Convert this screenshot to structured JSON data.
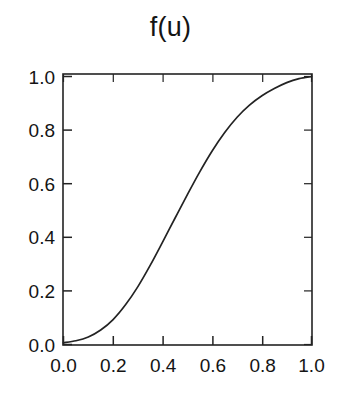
{
  "chart_data": {
    "type": "line",
    "title": "f(u)",
    "xlabel": "",
    "ylabel": "",
    "xlim": [
      0.0,
      1.0
    ],
    "ylim": [
      0.0,
      1.0
    ],
    "grid": false,
    "legend": false,
    "xticks": [
      "0.0",
      "0.2",
      "0.4",
      "0.6",
      "0.8",
      "1.0"
    ],
    "xtick_values": [
      0.0,
      0.2,
      0.4,
      0.6,
      0.8,
      1.0
    ],
    "yticks": [
      "0.0",
      "0.2",
      "0.4",
      "0.6",
      "0.8",
      "1.0"
    ],
    "ytick_values": [
      0.0,
      0.2,
      0.4,
      0.6,
      0.8,
      1.0
    ],
    "tick_direction": "in",
    "line_color": "#232323",
    "background_color": "#ffffff",
    "series": [
      {
        "name": "f(u)",
        "x": [
          0.0,
          0.05,
          0.1,
          0.15,
          0.2,
          0.25,
          0.3,
          0.35,
          0.4,
          0.45,
          0.5,
          0.55,
          0.6,
          0.65,
          0.7,
          0.75,
          0.8,
          0.85,
          0.9,
          0.95,
          1.0
        ],
        "values": [
          0.007,
          0.014,
          0.028,
          0.054,
          0.093,
          0.148,
          0.216,
          0.296,
          0.383,
          0.472,
          0.56,
          0.645,
          0.723,
          0.791,
          0.848,
          0.893,
          0.928,
          0.955,
          0.977,
          0.992,
          1.0
        ]
      }
    ]
  },
  "figure": {
    "title": "f(u)"
  }
}
